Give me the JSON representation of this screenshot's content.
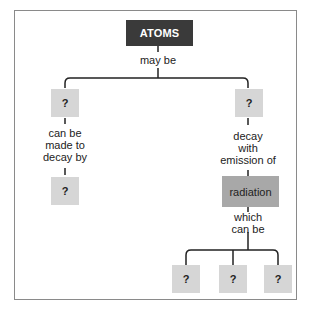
{
  "diagram": {
    "type": "concept-map",
    "root": {
      "label": "ATOMS"
    },
    "links": {
      "root_to_branches": "may be",
      "left_branch": [
        "can be",
        "made to",
        "decay by"
      ],
      "right_branch": [
        "decay",
        "with",
        "emission of"
      ],
      "radiation_to_leaves": [
        "which",
        "can be"
      ]
    },
    "nodes": {
      "left_top": "?",
      "left_bottom": "?",
      "right_top": "?",
      "radiation": "radiation",
      "leaf_1": "?",
      "leaf_2": "?",
      "leaf_3": "?"
    },
    "colors": {
      "root_fill": "#3a3a3a",
      "unknown_fill": "#d6d6d6",
      "radiation_fill": "#a8a8a8",
      "line": "#222222",
      "frame": "#8a8a8a"
    }
  }
}
